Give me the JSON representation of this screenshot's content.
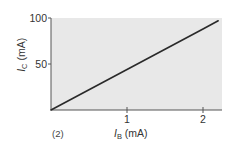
{
  "chart_data": {
    "type": "line",
    "title": "",
    "panel_label": "(2)",
    "xlabel": {
      "symbol": "I",
      "subscript": "B",
      "unit": " (mA)"
    },
    "ylabel": {
      "symbol": "I",
      "subscript": "C",
      "unit": " (mA)"
    },
    "xlim": [
      0,
      2.25
    ],
    "ylim": [
      0,
      100
    ],
    "xticks": [
      {
        "value": 1,
        "label": "1"
      },
      {
        "value": 2,
        "label": "2"
      }
    ],
    "yticks": [
      {
        "value": 50,
        "label": "50"
      },
      {
        "value": 100,
        "label": "100"
      }
    ],
    "grid": false,
    "series": [
      {
        "name": "IC vs IB",
        "x": [
          0,
          1,
          2,
          2.2
        ],
        "y": [
          0,
          44,
          88,
          97
        ]
      }
    ],
    "colors": {
      "plot_background": "#e8e8e8",
      "line": "#2a2a2a",
      "axis": "#555555"
    }
  }
}
